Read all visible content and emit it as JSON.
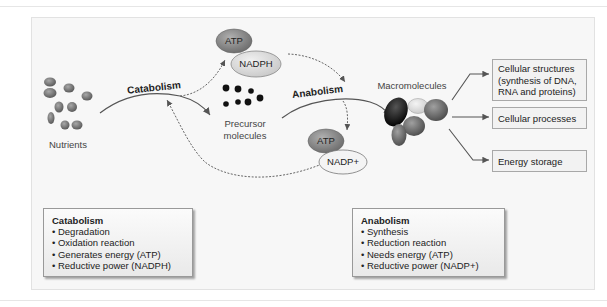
{
  "diagram": {
    "nutrients_label": "Nutrients",
    "catabolism_arrow_label": "Catabolism",
    "anabolism_arrow_label": "Anabolism",
    "precursor_label": "Precursor molecules",
    "precursor_line1": "Precursor",
    "precursor_line2": "molecules",
    "macromolecules_label": "Macromolecules",
    "top_cofactors": {
      "atp": "ATP",
      "nadph": "NADPH"
    },
    "bottom_cofactors": {
      "atp": "ATP",
      "nadp": "NADP+"
    },
    "outputs": [
      {
        "label": "Cellular structures (synthesis of DNA, RNA and proteins)",
        "line1": "Cellular structures",
        "line2": "(synthesis of DNA,",
        "line3": "RNA and proteins)"
      },
      {
        "label": "Cellular processes"
      },
      {
        "label": "Energy storage"
      }
    ],
    "catabolism_box": {
      "title": "Catabolism",
      "items": [
        "Degradation",
        "Oxidation reaction",
        "Generates energy (ATP)",
        "Reductive power (NADPH)"
      ]
    },
    "anabolism_box": {
      "title": "Anabolism",
      "items": [
        "Synthesis",
        "Reduction reaction",
        "Needs energy (ATP)",
        "Reductive power (NADP+)"
      ]
    },
    "colors": {
      "panel_bg": "#f7f7f7",
      "arrow": "#555555",
      "atp_fill": "#8c8c8c",
      "nadph_fill": "#dcdcdc",
      "nutrient_fill": "#6e6e6e"
    }
  }
}
